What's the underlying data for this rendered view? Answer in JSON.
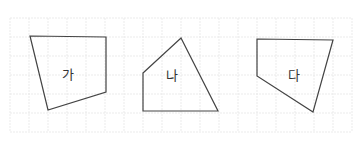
{
  "figure": {
    "grid": {
      "x": 10,
      "y": 18,
      "cols": 18,
      "rows": 6,
      "cell": 19,
      "color": "#e6e6e6"
    },
    "stroke_color": "#444444",
    "shapes": [
      {
        "label": "가",
        "points": "30,36 106,37 106,92 48,110",
        "label_x": 68,
        "label_y": 79
      },
      {
        "label": "나",
        "points": "143,73 181,38 218,111 143,111",
        "label_x": 172,
        "label_y": 80
      },
      {
        "label": "다",
        "points": "257,39 333,40 313,112 257,76",
        "label_x": 294,
        "label_y": 80
      }
    ]
  }
}
